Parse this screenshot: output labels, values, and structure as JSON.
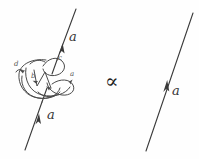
{
  "figure": {
    "type": "knot-diagram-equation",
    "background_color": "#fefefe",
    "ink_color": "#3a3a3a",
    "relation_symbol": "∝",
    "relation_name": "proportional-to",
    "left_term": {
      "name": "tangled-line-with-knot",
      "line": {
        "orientation": "upward",
        "from": [
          25,
          150
        ],
        "to": [
          76,
          9
        ],
        "arrow_positions": [
          [
            40,
            112
          ],
          [
            63,
            48
          ]
        ],
        "labels": [
          {
            "id": "a-lower-left",
            "text": "a",
            "x": 47,
            "y": 114
          },
          {
            "id": "a-upper-left",
            "text": "a",
            "x": 69,
            "y": 36
          }
        ]
      },
      "knot": {
        "name": "tangle-blob",
        "crossing_labels": [
          {
            "id": "label-d",
            "text": "d",
            "x": 15,
            "y": 64
          },
          {
            "id": "label-b",
            "text": "b",
            "x": 32,
            "y": 76
          },
          {
            "id": "label-c",
            "text": "c",
            "x": 59,
            "y": 58
          },
          {
            "id": "label-a-tangle",
            "text": "a",
            "x": 71,
            "y": 74
          }
        ]
      }
    },
    "right_term": {
      "name": "plain-oriented-line",
      "line": {
        "orientation": "upward",
        "from": [
          146,
          151
        ],
        "to": [
          193,
          13
        ],
        "arrow_positions": [
          [
            167,
            85
          ]
        ],
        "labels": [
          {
            "id": "a-right",
            "text": "a",
            "x": 173,
            "y": 89
          }
        ]
      }
    }
  }
}
